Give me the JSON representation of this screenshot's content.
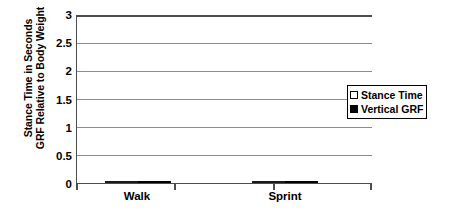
{
  "chart_data": {
    "type": "bar",
    "title": "",
    "xlabel": "",
    "ylabel_line1": "Stance Time in Seconds",
    "ylabel_line2": "GRF Relative to Body Weight",
    "categories": [
      "Walk",
      "Sprint"
    ],
    "series": [
      {
        "name": "Stance Time",
        "values": [
          0.62,
          0.13
        ],
        "color": "#e9e9e9"
      },
      {
        "name": "Vertical GRF",
        "values": [
          1.4,
          3.0
        ],
        "color": "#000000"
      }
    ],
    "ylim": [
      0,
      3
    ],
    "yticks": [
      "0",
      "0.5",
      "1",
      "1.5",
      "2",
      "2.5",
      "3"
    ],
    "ytick_values": [
      0,
      0.5,
      1,
      1.5,
      2,
      2.5,
      3
    ],
    "grid": true,
    "legend_position": "right"
  },
  "legend": {
    "entries": [
      {
        "label": "Stance Time",
        "marker": "open-square"
      },
      {
        "label": "Vertical GRF",
        "marker": "filled-square"
      }
    ]
  },
  "colors": {
    "stance_fill": "#e9e9e9",
    "grf_fill": "#000000",
    "axis": "#4d4d4d",
    "gridline": "#8c8c8c",
    "bar_border": "#1a1a1a",
    "background": "#ffffff"
  }
}
